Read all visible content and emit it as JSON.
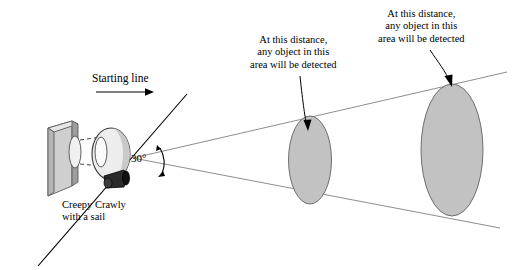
{
  "figure": {
    "type": "diagram",
    "background_color": "#ffffff",
    "labels": {
      "starting_line": "Starting line",
      "robot_name_line1": "Creepy Crawly",
      "robot_name_line2": "with a sail",
      "angle": "30°",
      "mid_callout_line1": "At this distance,",
      "mid_callout_line2": "any object in this",
      "mid_callout_line3": "area will be detected",
      "far_callout_line1": "At this distance,",
      "far_callout_line2": "any object in this",
      "far_callout_line3": "area will be detected"
    },
    "colors": {
      "line": "#000000",
      "cone_line": "#8c8c8c",
      "ellipse_fill": "#bfbfbf",
      "ellipse_stroke": "#6e6e6e",
      "block_face": "#cfcfcf",
      "block_side": "#9a9a9a",
      "block_top": "#e2e2e2",
      "robot_body_light": "#f2f2f2",
      "robot_body_shade": "#b8b8b8",
      "sensor_body": "#2b2b2b"
    },
    "geometry": {
      "cone_apex": [
        133,
        158
      ],
      "cone_half_angle_deg": 15,
      "mid_ellipse_center": [
        310,
        160
      ],
      "mid_ellipse_rx": 22,
      "mid_ellipse_ry": 44,
      "far_ellipse_center": [
        452,
        150
      ],
      "far_ellipse_rx": 32,
      "far_ellipse_ry": 66,
      "starting_line_from": [
        40,
        265
      ],
      "starting_line_to": [
        185,
        96
      ]
    }
  }
}
